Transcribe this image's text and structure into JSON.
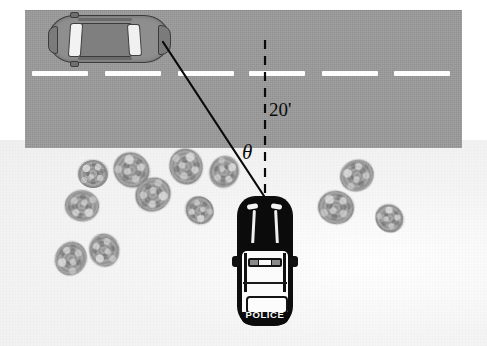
{
  "labels": {
    "distance": "20'",
    "angle": "θ",
    "police_text": "POLICE"
  },
  "colors": {
    "road": "#9a9a9a",
    "ground": "#f2f2f2",
    "lane_marking": "#fdfdfd",
    "bush": "#9f9f9f",
    "sedan_body": "#8e8e8e",
    "police_body": "#0d0d0d",
    "police_panel": "#fbfbfb",
    "line": "#0a0a0a"
  },
  "road": {
    "x": 25,
    "y": 10,
    "width": 437,
    "height": 138,
    "lane_dashes": [
      {
        "x": 32,
        "y": 71,
        "width": 56
      },
      {
        "x": 105,
        "y": 71,
        "width": 56
      },
      {
        "x": 178,
        "y": 71,
        "width": 56
      },
      {
        "x": 249,
        "y": 71,
        "width": 56
      },
      {
        "x": 322,
        "y": 71,
        "width": 56
      },
      {
        "x": 394,
        "y": 71,
        "width": 56
      }
    ]
  },
  "geometry": {
    "vertex": {
      "x": 265,
      "y": 197
    },
    "dashed_line": {
      "x1": 265,
      "y1": 40,
      "x2": 265,
      "y2": 195
    },
    "sight_line": {
      "x1": 163,
      "y1": 42,
      "x2": 264,
      "y2": 196
    },
    "angle_value_label": "20'",
    "angle_symbol": "θ"
  },
  "vehicles": {
    "suspect_car": {
      "name": "gray-sedan",
      "x": 48,
      "y": 15,
      "width": 122,
      "height": 48,
      "orientation": "horizontal"
    },
    "police_car": {
      "name": "police-cruiser",
      "x": 237,
      "y": 196,
      "width": 56,
      "height": 130,
      "orientation": "vertical",
      "badge": "POLICE"
    }
  },
  "bushes": [
    {
      "x": 78,
      "y": 160,
      "size": 30
    },
    {
      "x": 113,
      "y": 153,
      "size": 37
    },
    {
      "x": 168,
      "y": 150,
      "size": 36
    },
    {
      "x": 208,
      "y": 157,
      "size": 32
    },
    {
      "x": 135,
      "y": 178,
      "size": 36
    },
    {
      "x": 65,
      "y": 190,
      "size": 34
    },
    {
      "x": 185,
      "y": 197,
      "size": 29
    },
    {
      "x": 88,
      "y": 235,
      "size": 33
    },
    {
      "x": 54,
      "y": 243,
      "size": 34
    },
    {
      "x": 340,
      "y": 160,
      "size": 34
    },
    {
      "x": 318,
      "y": 191,
      "size": 36
    },
    {
      "x": 375,
      "y": 205,
      "size": 29
    }
  ]
}
